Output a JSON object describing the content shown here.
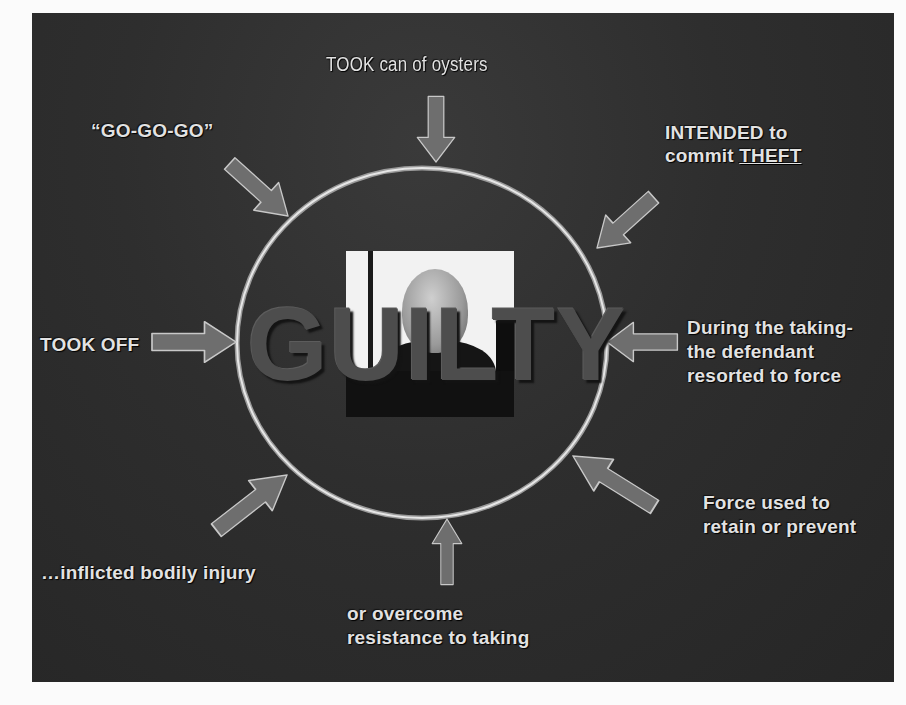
{
  "slide": {
    "center_word": "GUILTY",
    "center_photo": "defendant-photo",
    "colors": {
      "background": "#2e2e2e",
      "arrow_fill": "#6e6e6e",
      "arrow_outline": "#c8c8c8",
      "circle_stroke": "#d8d8d8",
      "text": "#e2e2e2",
      "guilty_text": "#4d4d4d"
    },
    "labels": {
      "top": "TOOK can of oysters",
      "top_left": "“GO-GO-GO”",
      "top_right_line1": "INTENDED to",
      "top_right_line2_prefix": "commit ",
      "top_right_line2_underlined": "THEFT",
      "left": "TOOK OFF",
      "right_line1": "During the taking-",
      "right_line2": "the defendant",
      "right_line3": "resorted to force",
      "bottom_right_line1": "Force used to",
      "bottom_right_line2": "retain or prevent",
      "bottom_left": "…inflicted bodily injury",
      "bottom_line1": "or overcome",
      "bottom_line2": "resistance to taking"
    },
    "arrows": [
      {
        "name": "top",
        "direction": "down"
      },
      {
        "name": "top-left",
        "direction": "down-right"
      },
      {
        "name": "top-right",
        "direction": "down-left"
      },
      {
        "name": "left",
        "direction": "right"
      },
      {
        "name": "right",
        "direction": "left"
      },
      {
        "name": "bottom-right",
        "direction": "up-left"
      },
      {
        "name": "bottom",
        "direction": "up"
      },
      {
        "name": "bottom-left",
        "direction": "up-right"
      }
    ]
  }
}
